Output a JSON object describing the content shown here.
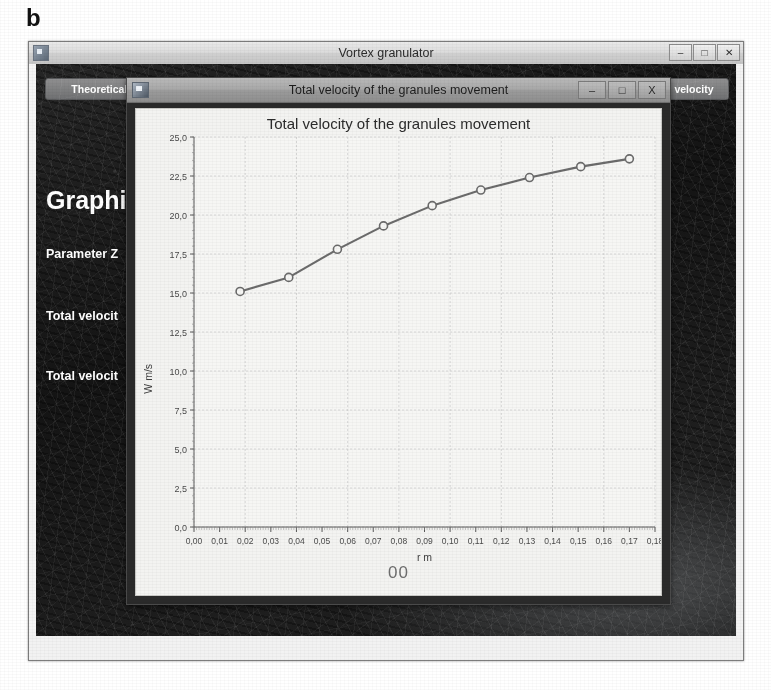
{
  "figure": {
    "panel_label": "b"
  },
  "app_window": {
    "title": "Vortex granulator",
    "controls": {
      "minimize": "–",
      "maximize": "□",
      "close": "✕"
    },
    "icon": "app-icon",
    "toolbar": {
      "left_button": "Theoretical b",
      "right_button": "velocity"
    },
    "panel": {
      "heading": "Graphic",
      "rows": [
        "Parameter Z",
        "Total velocit",
        "Total velocit"
      ]
    }
  },
  "chart_dialog": {
    "title": "Total velocity of the granules movement",
    "icon": "app-icon",
    "controls": {
      "minimize": "–",
      "maximize": "□",
      "close": "X"
    },
    "footer_value": "00"
  },
  "chart_data": {
    "type": "line",
    "title": "Total velocity of the granules movement",
    "xlabel": "r m",
    "ylabel": "W m/s",
    "xlim": [
      0.0,
      0.18
    ],
    "ylim": [
      0.0,
      25.0
    ],
    "grid": true,
    "legend": null,
    "xticks": [
      0.0,
      0.01,
      0.02,
      0.03,
      0.04,
      0.05,
      0.06,
      0.07,
      0.08,
      0.09,
      0.1,
      0.11,
      0.12,
      0.13,
      0.14,
      0.15,
      0.16,
      0.17,
      0.18
    ],
    "xtick_labels": [
      "0,00",
      "0,01",
      "0,02",
      "0,03",
      "0,04",
      "0,05",
      "0,06",
      "0,07",
      "0,08",
      "0,09",
      "0,10",
      "0,11",
      "0,12",
      "0,13",
      "0,14",
      "0,15",
      "0,16",
      "0,17",
      "0,18"
    ],
    "yticks": [
      0.0,
      2.5,
      5.0,
      7.5,
      10.0,
      12.5,
      15.0,
      17.5,
      20.0,
      22.5,
      25.0
    ],
    "ytick_labels": [
      "0,0",
      "2,5",
      "5,0",
      "7,5",
      "10,0",
      "12,5",
      "15,0",
      "17,5",
      "20,0",
      "22,5",
      "25,0"
    ],
    "series": [
      {
        "name": "Total velocity",
        "marker": "circle-open",
        "color": "#6b6b6b",
        "x": [
          0.018,
          0.037,
          0.056,
          0.074,
          0.093,
          0.112,
          0.131,
          0.151,
          0.17
        ],
        "y": [
          15.1,
          16.0,
          17.8,
          19.3,
          20.6,
          21.6,
          22.4,
          23.1,
          23.6
        ]
      }
    ]
  }
}
